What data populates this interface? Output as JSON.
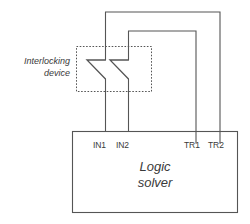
{
  "diagram": {
    "background_color": "#ffffff",
    "line_color": "#555555",
    "text_color": "#3a3a3a",
    "interlocking_device": {
      "label_line1": "Interlocking",
      "label_line2": "device",
      "contact_count": 2,
      "enclosure_style": "dashed"
    },
    "logic_solver": {
      "label_line1": "Logic",
      "label_line2": "solver",
      "terminals": [
        {
          "name": "IN1",
          "kind": "input"
        },
        {
          "name": "IN2",
          "kind": "input"
        },
        {
          "name": "TR1",
          "kind": "output"
        },
        {
          "name": "TR2",
          "kind": "output"
        }
      ]
    },
    "connections": [
      {
        "from": "TR2",
        "to": "IN1",
        "route": "outer-loop"
      },
      {
        "from": "TR1",
        "to": "IN2",
        "route": "inner-loop"
      }
    ]
  }
}
